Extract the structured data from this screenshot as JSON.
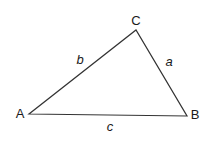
{
  "diagram": {
    "type": "triangle",
    "colors": {
      "stroke": "#333333",
      "text": "#1a1a1a",
      "background": "#ffffff"
    },
    "vertices": [
      {
        "id": "A",
        "label": "A",
        "x": 29,
        "y": 114,
        "label_x": 20,
        "label_y": 118
      },
      {
        "id": "B",
        "label": "B",
        "x": 187,
        "y": 116,
        "label_x": 195,
        "label_y": 119
      },
      {
        "id": "C",
        "label": "C",
        "x": 136,
        "y": 30,
        "label_x": 136,
        "label_y": 25
      }
    ],
    "sides": [
      {
        "id": "a",
        "label": "a",
        "from": "B",
        "to": "C",
        "label_x": 169,
        "label_y": 66
      },
      {
        "id": "b",
        "label": "b",
        "from": "A",
        "to": "C",
        "label_x": 80,
        "label_y": 64
      },
      {
        "id": "c",
        "label": "c",
        "from": "A",
        "to": "B",
        "label_x": 110,
        "label_y": 131
      }
    ]
  }
}
